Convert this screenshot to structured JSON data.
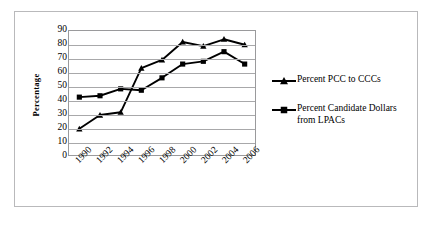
{
  "chart_data": {
    "type": "line",
    "title": "",
    "xlabel": "",
    "ylabel": "Percentage",
    "categories": [
      "1990",
      "1992",
      "1994",
      "1996",
      "1998",
      "2000",
      "2002",
      "2004",
      "2006"
    ],
    "ylim": [
      0,
      90
    ],
    "y_ticks": [
      90,
      80,
      70,
      60,
      50,
      40,
      30,
      20,
      10,
      0
    ],
    "grid": "horizontal",
    "legend_position": "right",
    "series": [
      {
        "name": "Percent PCC to CCCs",
        "marker": "triangle",
        "color": "#000000",
        "values": [
          19,
          29,
          31,
          63,
          69,
          82,
          79,
          84,
          80
        ]
      },
      {
        "name": "Percent Candidate Dollars from LPACs",
        "marker": "square",
        "color": "#000000",
        "values": [
          42,
          43,
          48,
          47,
          56,
          66,
          68,
          75,
          66
        ]
      }
    ]
  },
  "legend": {
    "entries": [
      {
        "label": "Percent PCC to CCCs",
        "marker": "triangle-marker-icon"
      },
      {
        "label": "Percent Candidate Dollars from LPACs",
        "marker": "square-marker-icon"
      }
    ]
  }
}
